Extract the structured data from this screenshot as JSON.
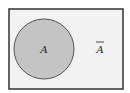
{
  "diagram": {
    "type": "venn",
    "universe": {
      "fill": "#f2f2f2",
      "stroke": "#333333"
    },
    "set": {
      "label": "A",
      "fill": "#c4c4c4",
      "stroke": "#555555"
    },
    "complement": {
      "label": "A",
      "overline": true
    }
  }
}
